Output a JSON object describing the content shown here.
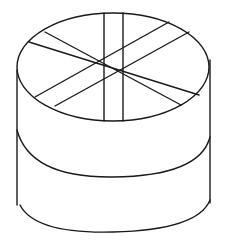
{
  "figure": {
    "stroke_color": "#1a1a1a",
    "background": "#ffffff",
    "top_ellipse": {
      "cx": 113,
      "cy": 67,
      "rx": 96,
      "ry": 54
    },
    "sides": {
      "left_x": 17,
      "right_x": 210,
      "top_y": 67,
      "bottom_y": 205
    },
    "cuts": [
      {
        "x1": 104,
        "y1": 13,
        "x2": 104,
        "y2": 121
      },
      {
        "x1": 123,
        "y1": 13,
        "x2": 123,
        "y2": 121
      },
      {
        "x1": 29,
        "y1": 42,
        "x2": 199,
        "y2": 95
      },
      {
        "x1": 45,
        "y1": 32,
        "x2": 181,
        "y2": 105
      },
      {
        "x1": 35,
        "y1": 97,
        "x2": 169,
        "y2": 22
      },
      {
        "x1": 55,
        "y1": 106,
        "x2": 189,
        "y2": 32
      }
    ]
  }
}
